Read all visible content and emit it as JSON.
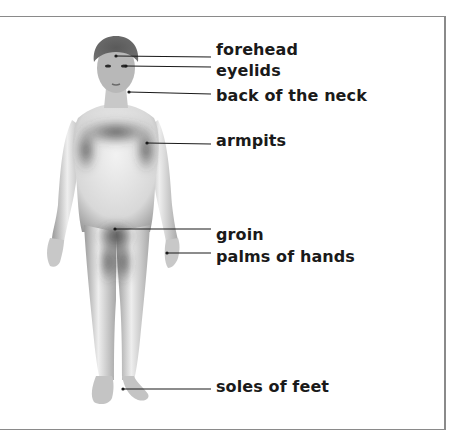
{
  "diagram": {
    "labels": [
      {
        "id": "forehead",
        "text": "forehead",
        "x": 216,
        "y": 40,
        "point": [
          116,
          56
        ],
        "line_end": [
          211,
          56
        ]
      },
      {
        "id": "eyelids",
        "text": "eyelids",
        "x": 216,
        "y": 61,
        "point": [
          126,
          66
        ],
        "line_end": [
          211,
          67
        ]
      },
      {
        "id": "back-of-neck",
        "text": "back of the neck",
        "x": 216,
        "y": 87,
        "point": [
          129,
          92
        ],
        "line_end": [
          211,
          94
        ]
      },
      {
        "id": "armpits",
        "text": "armpits",
        "x": 216,
        "y": 131,
        "point": [
          147,
          143
        ],
        "line_end": [
          211,
          144
        ]
      },
      {
        "id": "groin",
        "text": "groin",
        "x": 216,
        "y": 226,
        "point": [
          115,
          229
        ],
        "line_end": [
          211,
          229
        ]
      },
      {
        "id": "palms",
        "text": "palms of hands",
        "x": 216,
        "y": 248,
        "point": [
          167,
          253
        ],
        "line_end": [
          211,
          253
        ]
      },
      {
        "id": "soles",
        "text": "soles of feet",
        "x": 216,
        "y": 377,
        "point": [
          123,
          389
        ],
        "line_end": [
          211,
          389
        ]
      }
    ],
    "colors": {
      "text": "#1a1a1a",
      "leader_line": "#1a1a1a",
      "frame": "#8a8a8a",
      "skin_light": "#e6e6e6",
      "skin_shadow": "#4a4a4a"
    }
  }
}
